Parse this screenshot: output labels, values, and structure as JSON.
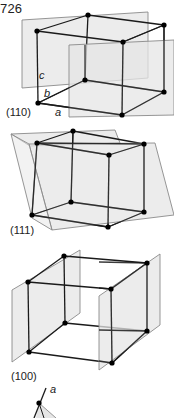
{
  "page": {
    "number_fragment": "726"
  },
  "figures": [
    {
      "id": "plane-110",
      "miller_label": "(110)",
      "axis_labels": {
        "a": "a",
        "b": "b",
        "c": "c"
      }
    },
    {
      "id": "plane-111",
      "miller_label": "(111)"
    },
    {
      "id": "plane-100",
      "miller_label": "(100)"
    }
  ],
  "axis_fragment": {
    "label": "a"
  },
  "colors": {
    "plane_fill": "#e6e6e6",
    "plane_stroke": "#8a8a8a",
    "edge": "#1a1a1a",
    "atom": "#000000"
  }
}
